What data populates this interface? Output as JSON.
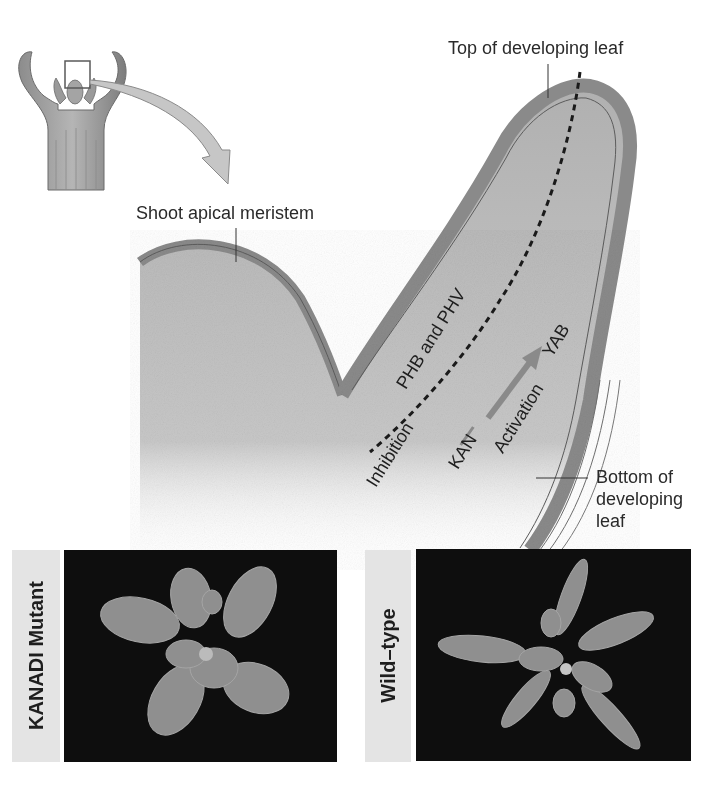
{
  "diagram": {
    "inset_label": "Seedling with shoot apex (boxed region enlarged)",
    "labels": {
      "top_of_leaf": "Top of developing leaf",
      "shoot_apical_meristem": "Shoot apical meristem",
      "bottom_of_leaf_line1": "Bottom of",
      "bottom_of_leaf_line2": "developing",
      "bottom_of_leaf_line3": "leaf",
      "phb_phv": "PHB and PHV",
      "inhibition": "Inhibition",
      "kan": "KAN",
      "activation": "Activation",
      "yab": "YAB"
    },
    "colors": {
      "tissue_fill": "#b8b8b8",
      "tissue_edge": "#7a7a7a",
      "outline": "#5c5c5c",
      "arrow_fill": "#c4c4c4",
      "activation_arrow": "#8a8a8a",
      "photo_bg": "#0e0e0e",
      "label_strip": "#e4e4e4"
    }
  },
  "photos": [
    {
      "label": "KANADI Mutant"
    },
    {
      "label": "Wild–type"
    }
  ]
}
